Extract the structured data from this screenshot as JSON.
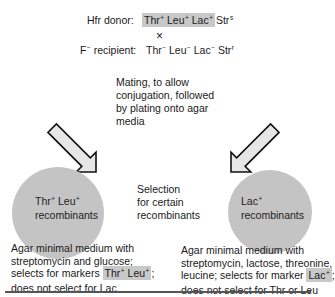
{
  "cross": {
    "donor": {
      "label": "Hfr donor:",
      "genes": [
        {
          "name": "Thr",
          "sup": "+"
        },
        {
          "name": "Leu",
          "sup": "+"
        },
        {
          "name": "Lac",
          "sup": "+"
        }
      ],
      "str": {
        "name": "Str",
        "sup": "s"
      }
    },
    "cross_symbol": "×",
    "recipient": {
      "label_prefix": "F",
      "label_sup": "−",
      "label_suffix": " recipient:",
      "genes": [
        {
          "name": "Thr",
          "sup": "−"
        },
        {
          "name": "Leu",
          "sup": "−"
        },
        {
          "name": "Lac",
          "sup": "−"
        },
        {
          "name": "Str",
          "sup": "r"
        }
      ]
    }
  },
  "mating": {
    "lines": [
      "Mating, to allow",
      "conjugation, followed",
      "by plating onto agar",
      "media"
    ]
  },
  "selection": {
    "lines": [
      "Selection",
      "for certain",
      "recombinants"
    ]
  },
  "left_plate": {
    "gene1": "Thr",
    "gene1_sup": "+",
    "gene2": "Leu",
    "gene2_sup": "+",
    "label2": "recombinants",
    "color": "#c4c4c4",
    "caption": {
      "line1": "Agar minimal medium with",
      "line2": "streptomycin and glucose;",
      "line3_prefix": "selects for markers ",
      "line3_hl_gene1": "Thr",
      "line3_hl_sup1": "+",
      "line3_hl_gene2": "Leu",
      "line3_hl_sup2": "+",
      "line3_suffix": ";",
      "line4": "does not select for Lac"
    }
  },
  "right_plate": {
    "gene1": "Lac",
    "gene1_sup": "+",
    "label2": "recombinants",
    "color": "#c4c4c4",
    "caption": {
      "line1": "Agar minimal medium with",
      "line2": "streptomycin, lactose, threonine,",
      "line3_prefix": "leucine; selects for marker ",
      "line3_hl_gene": "Lac",
      "line3_hl_sup": "+",
      "line3_suffix": ";",
      "line4": "does not select for Thr or Leu"
    }
  },
  "colors": {
    "highlight": "#c8c8c8",
    "plate": "#c4c4c4",
    "arrow_fill": "#e6e6e6",
    "arrow_stroke": "#111111"
  }
}
